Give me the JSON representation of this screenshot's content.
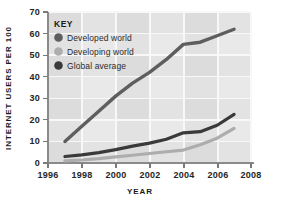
{
  "chart_data": {
    "type": "line",
    "title": "",
    "xlabel": "YEAR",
    "ylabel": "INTERNET USERS PER 100",
    "xlim": [
      1996,
      2008
    ],
    "ylim": [
      0,
      70
    ],
    "grid": true,
    "legend_position": "inside-top-left",
    "legend_title": "KEY",
    "x_ticks": [
      "1996",
      "1998",
      "2000",
      "2002",
      "2004",
      "2006",
      "2008"
    ],
    "y_ticks": [
      "0",
      "10",
      "20",
      "30",
      "40",
      "50",
      "60",
      "70"
    ],
    "x": [
      1997,
      1998,
      1999,
      2000,
      2001,
      2002,
      2003,
      2004,
      2005,
      2006,
      2007
    ],
    "series": [
      {
        "name": "Developed world",
        "color": "#5e5e5e",
        "values": [
          10,
          17,
          24,
          31,
          37,
          42,
          48,
          55,
          56,
          59,
          62
        ]
      },
      {
        "name": "Developing world",
        "color": "#adadad",
        "values": [
          1,
          1.4,
          2,
          2.8,
          3.6,
          4.4,
          5.2,
          6,
          8.5,
          11.5,
          16
        ]
      },
      {
        "name": "Global average",
        "color": "#3a3a3a",
        "values": [
          3,
          3.8,
          4.8,
          6.2,
          7.8,
          9.2,
          11,
          14,
          14.5,
          17.5,
          22.5
        ]
      }
    ]
  },
  "colors": {
    "page_background": "#ffffff",
    "plot_background": "#e9e9e9",
    "plot_band": "#dedede",
    "gridline": "#f7f7f7",
    "axis": "#8a8a8a",
    "text": "#262626"
  }
}
